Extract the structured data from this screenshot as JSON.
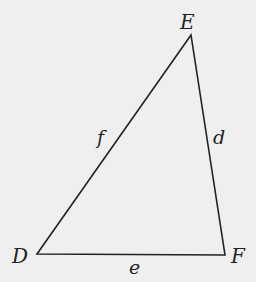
{
  "diagram": {
    "type": "triangle",
    "background_color": "#efefef",
    "line_color": "#222222",
    "vertices": {
      "E": {
        "label": "E",
        "x": 191,
        "y": 35
      },
      "D": {
        "label": "D",
        "x": 37,
        "y": 254
      },
      "F": {
        "label": "F",
        "x": 225,
        "y": 255
      }
    },
    "sides": {
      "f": {
        "label": "f",
        "from": "D",
        "to": "E"
      },
      "d": {
        "label": "d",
        "from": "E",
        "to": "F"
      },
      "e": {
        "label": "e",
        "from": "D",
        "to": "F"
      }
    }
  }
}
